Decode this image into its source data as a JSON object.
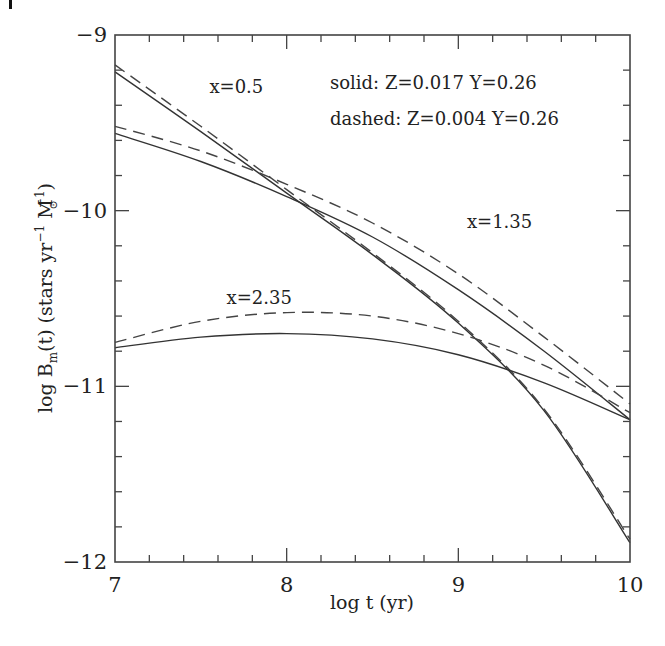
{
  "chart_data": {
    "type": "line",
    "title": "",
    "xlabel": "log t (yr)",
    "ylabel": "log B_m(t) (stars yr^-1 M_sun^-1)",
    "ylabel_parts": {
      "prefix": "log B",
      "sub": "m",
      "mid": "(t) (stars yr",
      "sup1": "−1",
      "mid2": " M",
      "sub2": "⊙",
      "sup2": "−1",
      "suffix": ")"
    },
    "xlim": [
      7,
      10
    ],
    "ylim": [
      -12,
      -9
    ],
    "xticks_major": [
      7,
      8,
      9,
      10
    ],
    "xtick_labels": [
      "7",
      "8",
      "9",
      "10"
    ],
    "xticks_minor_step": 0.2,
    "yticks_major": [
      -12,
      -11,
      -10,
      -9
    ],
    "ytick_labels": [
      "−12",
      "−11",
      "−10",
      "−9"
    ],
    "yticks_minor_step": 0.2,
    "grid": false,
    "legend": {
      "placement": "top-right",
      "lines": [
        "solid: Z=0.017 Y=0.26",
        "dashed: Z=0.004 Y=0.26"
      ]
    },
    "annotations": [
      {
        "text": "x=0.5",
        "x": 7.55,
        "y": -9.33
      },
      {
        "text": "x=1.35",
        "x": 9.05,
        "y": -10.1
      },
      {
        "text": "x=2.35",
        "x": 7.65,
        "y": -10.53
      }
    ],
    "series": [
      {
        "name": "x=0.5 solid (Z=0.017)",
        "style": "solid",
        "x": [
          7.0,
          7.5,
          8.0,
          8.5,
          9.0,
          9.5,
          10.0
        ],
        "y": [
          -9.21,
          -9.55,
          -9.9,
          -10.25,
          -10.64,
          -11.14,
          -11.89
        ]
      },
      {
        "name": "x=0.5 dashed (Z=0.004)",
        "style": "dashed",
        "x": [
          7.0,
          7.5,
          8.0,
          8.5,
          9.0,
          9.5,
          10.0
        ],
        "y": [
          -9.17,
          -9.52,
          -9.88,
          -10.24,
          -10.63,
          -11.13,
          -11.87
        ]
      },
      {
        "name": "x=1.35 solid (Z=0.017)",
        "style": "solid",
        "x": [
          7.0,
          7.5,
          8.0,
          8.5,
          9.0,
          9.5,
          10.0
        ],
        "y": [
          -9.56,
          -9.72,
          -9.92,
          -10.15,
          -10.45,
          -10.8,
          -11.19
        ]
      },
      {
        "name": "x=1.35 dashed (Z=0.004)",
        "style": "dashed",
        "x": [
          7.0,
          7.5,
          8.0,
          8.5,
          9.0,
          9.5,
          10.0
        ],
        "y": [
          -9.52,
          -9.66,
          -9.85,
          -10.07,
          -10.36,
          -10.72,
          -11.1
        ]
      },
      {
        "name": "x=2.35 solid (Z=0.017)",
        "style": "solid",
        "x": [
          7.0,
          7.5,
          8.0,
          8.5,
          9.0,
          9.5,
          10.0
        ],
        "y": [
          -10.78,
          -10.72,
          -10.7,
          -10.73,
          -10.82,
          -10.98,
          -11.19
        ]
      },
      {
        "name": "x=2.35 dashed (Z=0.004)",
        "style": "dashed",
        "x": [
          7.0,
          7.5,
          8.0,
          8.5,
          9.0,
          9.5,
          10.0
        ],
        "y": [
          -10.75,
          -10.63,
          -10.58,
          -10.6,
          -10.7,
          -10.88,
          -11.15
        ]
      }
    ]
  }
}
